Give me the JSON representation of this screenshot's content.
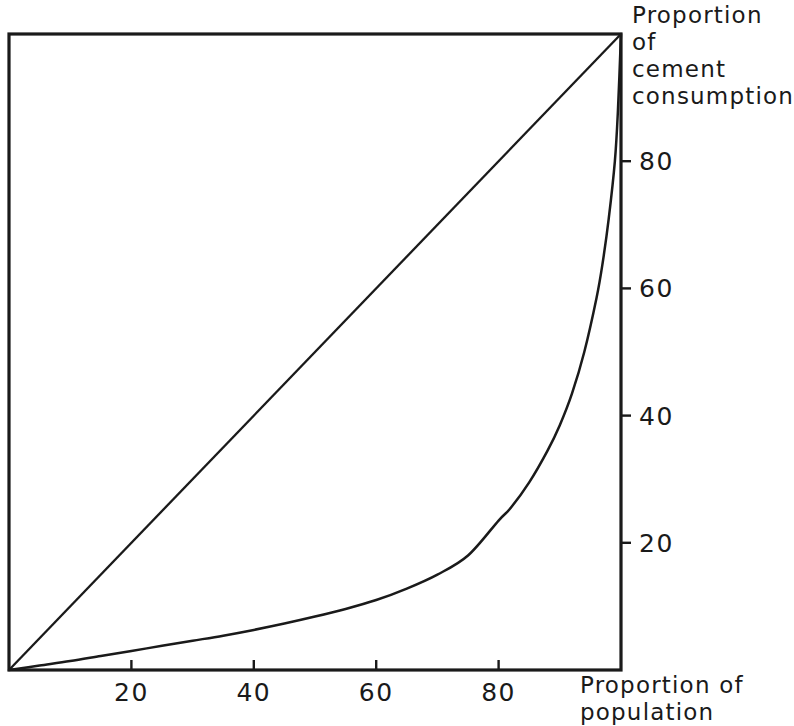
{
  "chart_data": {
    "type": "line",
    "title": "",
    "subtitle": "",
    "xlabel": "Proportion of population",
    "ylabel": "Proportion of cement consumption",
    "xlim": [
      0,
      100
    ],
    "ylim": [
      0,
      100
    ],
    "grid": false,
    "legend_position": "none",
    "x_ticks": [
      20,
      40,
      60,
      80
    ],
    "y_ticks": [
      20,
      40,
      60,
      80
    ],
    "x_tick_labels": [
      "20",
      "40",
      "60",
      "80"
    ],
    "y_tick_labels": [
      "20",
      "40",
      "60",
      "80"
    ],
    "y_axis_side": "right",
    "series": [
      {
        "name": "Line of equality",
        "style": "straight-diagonal",
        "x": [
          0,
          100
        ],
        "values": [
          0,
          100
        ]
      },
      {
        "name": "Lorenz curve of cement consumption",
        "style": "curve",
        "x": [
          0,
          5,
          10,
          15,
          20,
          25,
          30,
          35,
          40,
          45,
          50,
          55,
          60,
          65,
          70,
          75,
          80,
          82,
          85,
          88,
          90,
          92,
          94,
          96,
          97,
          98,
          99,
          99.5,
          100
        ],
        "values": [
          0,
          0.7,
          1.4,
          2.2,
          3.0,
          3.8,
          4.6,
          5.4,
          6.3,
          7.3,
          8.4,
          9.6,
          11.0,
          12.8,
          15.0,
          18.0,
          23.5,
          25.5,
          29.5,
          34.5,
          38.5,
          43.5,
          50.0,
          58.5,
          64.0,
          71.0,
          80.0,
          88.0,
          100
        ]
      }
    ],
    "annotations": []
  },
  "axis_titles": {
    "y": "Proportion of\ncement\nconsumption",
    "x": "Proportion of\npopulation"
  },
  "colors": {
    "line": "#1a1a1a",
    "frame": "#1a1a1a",
    "background": "#ffffff",
    "text": "#1a1a1a"
  },
  "geometry": {
    "plot_left": 9,
    "plot_right": 621,
    "plot_top": 34,
    "plot_bottom": 670
  }
}
